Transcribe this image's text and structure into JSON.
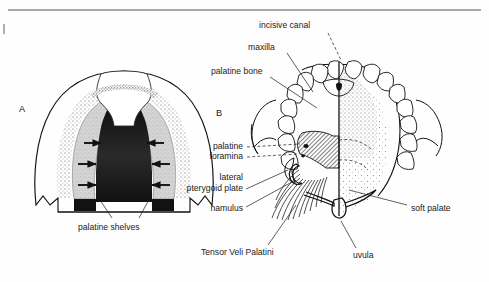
{
  "figure": {
    "background_color": "#fefefe",
    "ink_color": "#111111",
    "panels": [
      {
        "id": "A",
        "label": "A",
        "x": 22,
        "y": 110,
        "title": "fetal palate with palatine shelves"
      },
      {
        "id": "B",
        "label": "B",
        "x": 219,
        "y": 114,
        "title": "adult hard and soft palate from below"
      }
    ],
    "top_rule": {
      "x1": 8,
      "y1": 10,
      "x2": 481,
      "y2": 10,
      "color": "#555555"
    },
    "margin_mark": {
      "x": 3,
      "y": 24,
      "width": 2,
      "height": 10,
      "color": "#999999"
    }
  },
  "labels": {
    "panel_a": [
      {
        "name": "palatine-shelves",
        "text": "palatine shelves",
        "x": 78,
        "y": 228,
        "anchor": "start",
        "leaders": [
          {
            "points": "112,218 96,192"
          },
          {
            "points": "139,218 152,192"
          }
        ]
      }
    ],
    "panel_b": [
      {
        "name": "incisive-canal",
        "text": "incisive canal",
        "x": 259,
        "y": 26,
        "anchor": "start",
        "leaders": [
          {
            "points": "328,33 341,60",
            "dashed": true
          }
        ]
      },
      {
        "name": "maxilla",
        "text": "maxilla",
        "x": 248,
        "y": 48,
        "anchor": "start",
        "leaders": [
          {
            "points": "285,53 312,92"
          }
        ]
      },
      {
        "name": "palatine-bone",
        "text": "palatine bone",
        "x": 211,
        "y": 72,
        "anchor": "start",
        "leaders": [
          {
            "points": "268,77 316,107"
          }
        ]
      },
      {
        "name": "palatine-foramina",
        "text": "palatine",
        "x": 243,
        "y": 147,
        "anchor": "end",
        "leaders": [
          {
            "points": "247,149 300,144",
            "dashed": true
          }
        ]
      },
      {
        "name": "palatine-foramina-line2",
        "text": "foramina",
        "x": 243,
        "y": 157,
        "anchor": "end",
        "leaders": [
          {
            "points": "247,158 299,153",
            "dashed": true
          }
        ]
      },
      {
        "name": "lateral-pterygoid-plate",
        "text": "lateral",
        "x": 243,
        "y": 178,
        "anchor": "end",
        "leaders": []
      },
      {
        "name": "lateral-pterygoid-plate-line2",
        "text": "pterygoid plate",
        "x": 243,
        "y": 189,
        "anchor": "end",
        "leaders": [
          {
            "points": "246,189 295,173"
          }
        ]
      },
      {
        "name": "hamulus",
        "text": "hamulus",
        "x": 243,
        "y": 209,
        "anchor": "end",
        "leaders": [
          {
            "points": "246,207 292,186"
          }
        ]
      },
      {
        "name": "tensor-veli-palatini",
        "text": "Tensor Veli Palatini",
        "x": 201,
        "y": 253,
        "anchor": "start",
        "leaders": [
          {
            "points": "268,245 295,205"
          }
        ]
      },
      {
        "name": "soft-palate",
        "text": "soft palate",
        "x": 411,
        "y": 209,
        "anchor": "start",
        "leaders": [
          {
            "points": "407,205 349,190"
          }
        ]
      },
      {
        "name": "uvula",
        "text": "uvula",
        "x": 353,
        "y": 256,
        "anchor": "start",
        "leaders": [
          {
            "points": "356,248 340,221"
          }
        ]
      }
    ]
  },
  "panel_a_anatomy": {
    "name": "fetal-palate-arrows",
    "arrow_color": "#111111",
    "shelf_fill": "#d2d2d2",
    "cleft_fill": "#141414",
    "arrows": [
      {
        "side": "left",
        "x1": 84,
        "y1": 143,
        "x2": 99,
        "y2": 143
      },
      {
        "side": "left",
        "x1": 80,
        "y1": 164,
        "x2": 96,
        "y2": 164
      },
      {
        "side": "left",
        "x1": 80,
        "y1": 185,
        "x2": 96,
        "y2": 185
      },
      {
        "side": "right",
        "x1": 165,
        "y1": 143,
        "x2": 150,
        "y2": 143
      },
      {
        "side": "right",
        "x1": 169,
        "y1": 164,
        "x2": 153,
        "y2": 164
      },
      {
        "side": "right",
        "x1": 169,
        "y1": 185,
        "x2": 153,
        "y2": 185
      }
    ]
  },
  "panel_b_anatomy": {
    "name": "adult-palate",
    "midline": {
      "x": 339,
      "y1": 62,
      "y2": 215
    },
    "teeth_count": 16,
    "stipple_fill": "#9a9a9a",
    "hatch_fill": "#8e8e8e"
  }
}
